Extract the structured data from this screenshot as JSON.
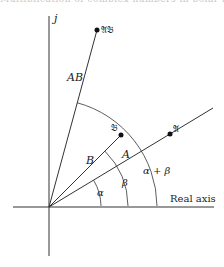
{
  "figure": {
    "header_cutoff_text": "Multiplication of complex numbers in polar form",
    "axes": {
      "imag_label": "j",
      "real_label": "Real axis"
    },
    "points": [
      {
        "id": "A",
        "label": "𝔄",
        "x": 170,
        "y": 134
      },
      {
        "id": "B",
        "label": "𝔅",
        "x": 121,
        "y": 135
      },
      {
        "id": "AB",
        "label": "𝔄𝔅",
        "x": 97,
        "y": 30
      }
    ],
    "vector_labels": {
      "A": "A",
      "B": "B",
      "AB": "AB"
    },
    "angle_labels": {
      "alpha": "α",
      "beta": "β",
      "alpha_plus_beta": "α + β",
      "alpha_small": "α"
    },
    "colors": {
      "stroke": "#333333",
      "text": "#222222",
      "background": "#ffffff"
    }
  }
}
